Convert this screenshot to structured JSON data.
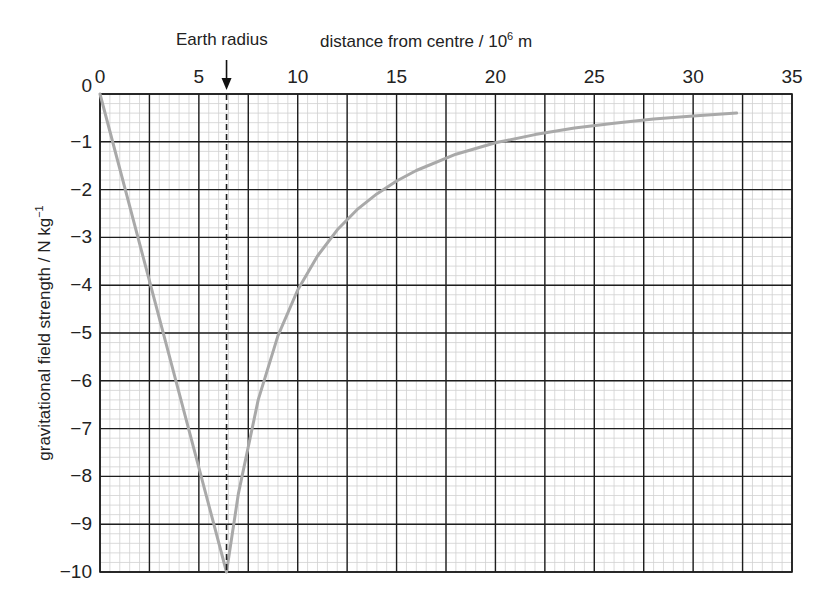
{
  "chart_data": {
    "type": "line",
    "title": "",
    "xlabel": "distance from centre / 10^6 m",
    "xlabel_parts": {
      "main": "distance from centre / 10",
      "sup": "6",
      "unit": " m"
    },
    "ylabel": "gravitational field strength / N kg^-1",
    "ylabel_parts": {
      "main": "gravitational field strength / N kg",
      "sup": "−1"
    },
    "xlim": [
      0,
      35
    ],
    "ylim": [
      -10,
      0
    ],
    "x_ticks": [
      0,
      5,
      10,
      15,
      20,
      25,
      30,
      35
    ],
    "x_tick_labels": [
      "0",
      "5",
      "10",
      "15",
      "20",
      "25",
      "30",
      "35"
    ],
    "y_ticks": [
      0,
      -1,
      -2,
      -3,
      -4,
      -5,
      -6,
      -7,
      -8,
      -9,
      -10
    ],
    "y_tick_labels": [
      "0",
      "−1",
      "−2",
      "−3",
      "−4",
      "−5",
      "−6",
      "−7",
      "−8",
      "−9",
      "−10"
    ],
    "grid": {
      "major_x_step": 2.5,
      "major_y_step": 1,
      "minor_x_step": 0.5,
      "minor_y_step": 0.2,
      "on": true
    },
    "x_axis_position": "top",
    "annotations": [
      {
        "text": "Earth radius",
        "x": 6.4,
        "style": "arrow + dashed vertical line"
      }
    ],
    "series": [
      {
        "name": "gravitational field strength",
        "color": "#a9a9a9",
        "x": [
          0,
          6.4,
          7,
          8,
          9,
          10,
          11,
          12,
          13,
          14,
          15,
          16,
          18,
          20,
          22,
          24,
          26,
          28,
          30,
          32.2
        ],
        "values": [
          0,
          -10,
          -8.36,
          -6.4,
          -5.06,
          -4.1,
          -3.39,
          -2.84,
          -2.42,
          -2.09,
          -1.82,
          -1.6,
          -1.26,
          -1.02,
          -0.85,
          -0.71,
          -0.61,
          -0.52,
          -0.46,
          -0.4
        ]
      }
    ],
    "legend": null
  },
  "colors": {
    "major_grid": "#1e1e1e",
    "minor_grid": "#d0d0d0",
    "curve": "#a9a9a9",
    "earth_radius_line": "#1e1e1e"
  }
}
